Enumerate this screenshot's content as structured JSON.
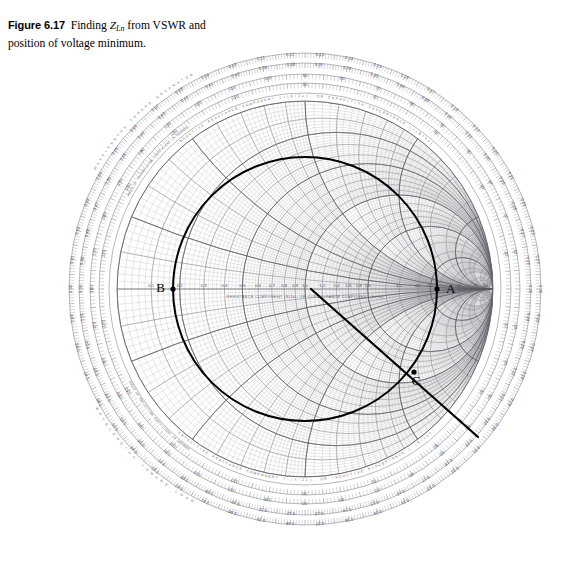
{
  "figure": {
    "label": "Figure 6.17",
    "caption_line1": "Finding ",
    "caption_symbol": "Z",
    "caption_subscript": "Ln",
    "caption_line1_rest": " from VSWR and",
    "caption_line2": "position of voltage minimum."
  },
  "chart": {
    "type": "smith-chart",
    "center_label": "",
    "axis_label": "RESISTANCE COMPONENT (R/Zo), OR CONDUCTANCE COMPONENT (G/Yo)",
    "angle_ring_label_upper": "ANGLE OF TRANSMISSION COEFFICIENT IN DEGREES",
    "angle_ring_label_lower": "ANGLE OF REFLECTION COEFFICIENT IN DEGREES",
    "wavelength_ring_label_toward_generator": "WAVELENGTHS TOWARD GENERATOR",
    "wavelength_ring_label_toward_load": "WAVELENGTHS TOWARD LOAD",
    "inductive_label": "INDUCTIVE REACTANCE COMPONENT (+jX/Zo), OR CAPACITIVE SUSCEPTANCE (+jB/Yo)",
    "capacitive_label": "CAPACITIVE REACTANCE COMPONENT (-jX/Zo), OR INDUCTIVE SUSCEPTANCE (-jB/Yo)"
  },
  "points": [
    {
      "id": "A",
      "label": "A",
      "x": 437,
      "y": 289,
      "desc": "intersection of VSWR circle with right (voltage maximum) axis"
    },
    {
      "id": "B",
      "label": "B",
      "x": 173,
      "y": 289,
      "desc": "intersection of VSWR circle with left (voltage minimum) axis"
    },
    {
      "id": "C",
      "label": "C",
      "x": 414,
      "y": 372,
      "desc": "load impedance point on the VSWR circle"
    }
  ],
  "construction": {
    "vswr_circle": {
      "cx": 305,
      "cy": 289,
      "r": 132,
      "stroke": "#000000",
      "width": 2.0
    },
    "radial_line": {
      "x1": 311,
      "y1": 289,
      "x2": 478,
      "y2": 437,
      "stroke": "#000000",
      "width": 2.2
    }
  },
  "resistance_axis_ticks": [
    "0.1",
    "0.2",
    "0.3",
    "0.4",
    "0.5",
    "0.6",
    "0.7",
    "0.8",
    "0.9",
    "1.0",
    "1.2",
    "1.4",
    "1.6",
    "1.8",
    "2.0",
    "3.0",
    "4.0",
    "5.0",
    "10",
    "20",
    "50"
  ],
  "reactance_values": [
    "0.2",
    "0.5",
    "1.0",
    "2.0",
    "5.0"
  ],
  "wavelength_scale_top": [
    "0.11",
    "0.12",
    "0.13",
    "0.14"
  ],
  "wavelength_scale_top_inner": [
    "0.39",
    "0.38",
    "0.37",
    "0.36"
  ],
  "wavelength_scale_bottom": [
    "0.36",
    "0.37",
    "0.38",
    "0.39"
  ],
  "wavelength_scale_bottom_inner": [
    "0.14",
    "0.13",
    "0.12",
    "0.11"
  ],
  "wavelength_scale_left": [
    "0.15",
    "0.16",
    "0.17",
    "0.18",
    "0.19",
    "0.20",
    "0.21",
    "0.22",
    "0.23",
    "0.24",
    "0.25"
  ],
  "wavelength_scale_right": [
    "0.05",
    "0.06",
    "0.07",
    "0.08",
    "0.09",
    "0.10",
    "0.45",
    "0.46",
    "0.47",
    "0.48",
    "0.49",
    "0.0"
  ],
  "angle_scale": [
    "20",
    "40",
    "60",
    "80",
    "100",
    "120",
    "140",
    "160",
    "180",
    "-160",
    "-140",
    "-120",
    "-100",
    "-80",
    "-60",
    "-40",
    "-20"
  ],
  "colors": {
    "grid_light": "#b9b9bd",
    "grid_mid": "#8d8d93",
    "grid_dark": "#5c5c62",
    "construction": "#000000",
    "background": "#ffffff",
    "text": "#3a3a40"
  }
}
